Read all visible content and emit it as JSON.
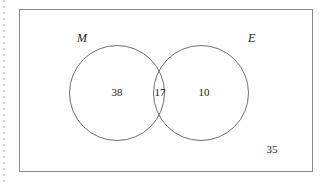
{
  "diagram": {
    "type": "venn-two-set",
    "universal_set": {
      "outside_count": "35"
    },
    "sets": [
      {
        "id": "M",
        "label": "M",
        "only_count": "38"
      },
      {
        "id": "E",
        "label": "E",
        "only_count": "10"
      }
    ],
    "intersection": {
      "count": "17"
    },
    "colors": {
      "background": "#fefefe",
      "rectangle_stroke": "#8a8a8a",
      "circle_stroke": "#6f6f6f",
      "text": "#1d1d1d",
      "margin_rule": "#c9c9c9"
    }
  }
}
